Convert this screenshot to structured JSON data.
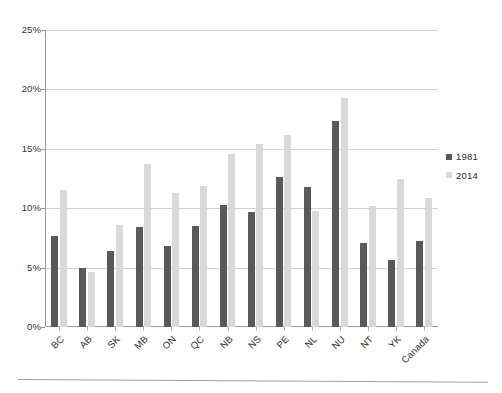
{
  "chart_data": {
    "type": "bar",
    "title": "",
    "subtitle": "",
    "xlabel": "",
    "ylabel": "",
    "ylim": [
      0,
      25
    ],
    "y_tick_labels": [
      "0%",
      "5%",
      "10%",
      "15%",
      "20%",
      "25%"
    ],
    "y_tick_values": [
      0,
      5,
      10,
      15,
      20,
      25
    ],
    "y_unit": "%",
    "grid": true,
    "legend_position": "right",
    "categories": [
      "BC",
      "AB",
      "SK",
      "MB",
      "ON",
      "QC",
      "NB",
      "NS",
      "PE",
      "NL",
      "NU",
      "NT",
      "YK",
      "Canada"
    ],
    "series": [
      {
        "name": "1981",
        "color": "#595959",
        "values": [
          7.7,
          5.0,
          6.4,
          8.4,
          6.8,
          8.5,
          10.3,
          9.7,
          12.6,
          11.8,
          17.3,
          7.1,
          5.6,
          7.2
        ]
      },
      {
        "name": "2014",
        "color": "#d9d9d9",
        "values": [
          11.5,
          4.6,
          8.6,
          13.7,
          11.3,
          11.9,
          14.6,
          15.4,
          16.2,
          9.8,
          19.3,
          10.2,
          12.5,
          10.9
        ]
      }
    ]
  },
  "legend": {
    "items": [
      {
        "label": "1981",
        "color": "#595959"
      },
      {
        "label": "2014",
        "color": "#d9d9d9"
      }
    ]
  }
}
